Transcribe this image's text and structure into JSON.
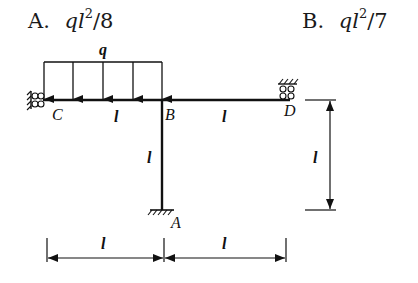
{
  "options": [
    {
      "letter": "A.",
      "var": "ql",
      "exp": "2",
      "denom": "/8"
    },
    {
      "letter": "B.",
      "var": "ql",
      "exp": "2",
      "denom": "/7"
    }
  ],
  "diagram": {
    "load_label": "q",
    "nodes": {
      "C": "C",
      "B": "B",
      "D": "D",
      "A": "A"
    },
    "span_CB": "l",
    "span_BD": "l",
    "column_BA": "l",
    "dim_vertical": "l",
    "dim_horizontal_left": "l",
    "dim_horizontal_right": "l"
  },
  "colors": {
    "line": "#111111",
    "background": "#ffffff"
  }
}
